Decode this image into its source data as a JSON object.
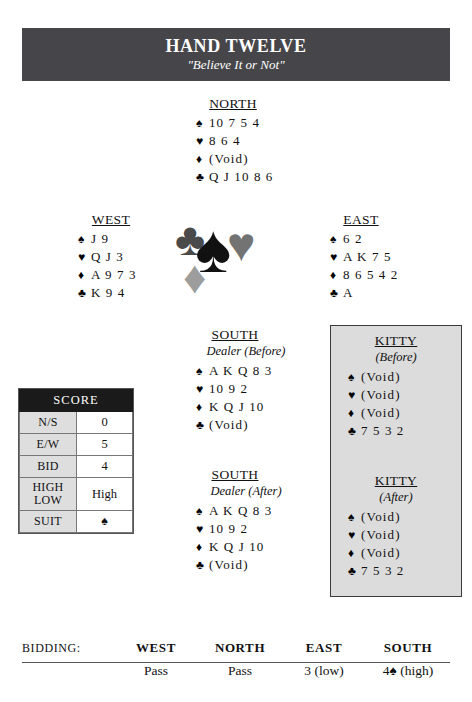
{
  "banner": {
    "title": "HAND TWELVE",
    "subtitle": "\"Believe It or Not\""
  },
  "pips": {
    "spade": "♠",
    "heart": "♥",
    "diamond": "♦",
    "club": "♣"
  },
  "hands": {
    "north": {
      "label": "NORTH",
      "spades": "10 7 5 4",
      "hearts": "8 6 4",
      "diamonds": "(Void)",
      "clubs": "Q J 10 8 6"
    },
    "west": {
      "label": "WEST",
      "spades": "J 9",
      "hearts": "Q J 3",
      "diamonds": "A 9 7 3",
      "clubs": "K 9 4"
    },
    "east": {
      "label": "EAST",
      "spades": "6 2",
      "hearts": "A K 7 5",
      "diamonds": "8 6 5 4 2",
      "clubs": "A"
    },
    "south_before": {
      "label": "SOUTH",
      "sub": "Dealer (Before)",
      "spades": "A K Q 8 3",
      "hearts": "10 9 2",
      "diamonds": "K Q J 10",
      "clubs": "(Void)"
    },
    "south_after": {
      "label": "SOUTH",
      "sub": "Dealer (After)",
      "spades": "A K Q 8 3",
      "hearts": "10 9 2",
      "diamonds": "K Q J 10",
      "clubs": "(Void)"
    },
    "kitty_before": {
      "label": "KITTY",
      "sub": "(Before)",
      "spades": "(Void)",
      "hearts": "(Void)",
      "diamonds": "(Void)",
      "clubs": "7 5 3 2"
    },
    "kitty_after": {
      "label": "KITTY",
      "sub": "(After)",
      "spades": "(Void)",
      "hearts": "(Void)",
      "diamonds": "(Void)",
      "clubs": "7 5 3 2"
    }
  },
  "score": {
    "header": "SCORE",
    "rows": [
      {
        "label": "N/S",
        "value": "0"
      },
      {
        "label": "E/W",
        "value": "5"
      },
      {
        "label": "Bid",
        "value": "4"
      }
    ],
    "high_low": {
      "label_top": "High",
      "label_bottom": "Low",
      "value": "High"
    },
    "suit": {
      "label": "Suit",
      "value": "♠"
    }
  },
  "bidding": {
    "label": "BIDDING:",
    "columns": [
      "WEST",
      "NORTH",
      "EAST",
      "SOUTH"
    ],
    "bids": [
      "Pass",
      "Pass",
      "3 (low)",
      "4♠ (high)"
    ]
  }
}
